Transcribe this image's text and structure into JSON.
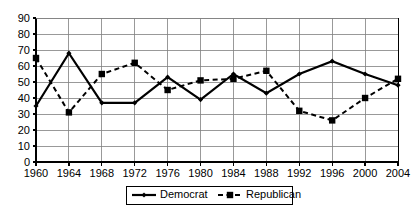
{
  "chart_data": {
    "type": "line",
    "title": "",
    "subtitle": "",
    "xlabel": "",
    "ylabel": "",
    "x": [
      1960,
      1964,
      1968,
      1972,
      1976,
      1980,
      1984,
      1988,
      1992,
      1996,
      2000,
      2004
    ],
    "categories": [
      "1960",
      "1964",
      "1968",
      "1972",
      "1976",
      "1980",
      "1984",
      "1988",
      "1992",
      "1996",
      "2000",
      "2004"
    ],
    "xtick_labels": [
      "1960",
      "1964",
      "1968",
      "1972",
      "1976",
      "1980",
      "1984",
      "1988",
      "1992",
      "1996",
      "2000",
      "2004"
    ],
    "ytick_labels": [
      "0",
      "10",
      "20",
      "30",
      "40",
      "50",
      "60",
      "70",
      "80",
      "90"
    ],
    "yticks": [
      0,
      10,
      20,
      30,
      40,
      50,
      60,
      70,
      80,
      90
    ],
    "ylim": [
      0,
      90
    ],
    "xlim": [
      1960,
      2004
    ],
    "grid": true,
    "grid_axis": "both",
    "legend_position": "bottom-center",
    "series": [
      {
        "name": "Democrat",
        "values": [
          35,
          68,
          37,
          37,
          53,
          39,
          55,
          43,
          55,
          63,
          55,
          48
        ],
        "line_style": "solid",
        "marker": "diamond",
        "color": "#000000"
      },
      {
        "name": "Republican",
        "values": [
          65,
          31,
          55,
          62,
          45,
          51,
          52,
          57,
          32,
          26,
          40,
          52
        ],
        "line_style": "dashed",
        "marker": "square",
        "color": "#000000"
      }
    ]
  },
  "legend": {
    "entries": [
      {
        "label": "Democrat",
        "marker": "diamond",
        "style": "solid"
      },
      {
        "label": "Republican",
        "marker": "square",
        "style": "dashed"
      }
    ]
  },
  "colors": {
    "axis": "#000000",
    "grid": "#808080",
    "background": "#ffffff",
    "series": "#000000"
  }
}
